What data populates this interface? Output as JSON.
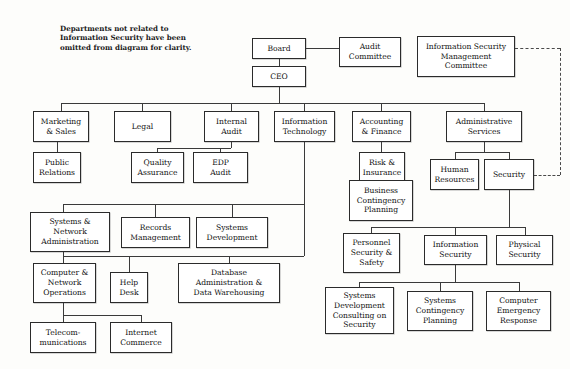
{
  "diagram": {
    "note": "Departments not related to\nInformation Security have been\nomitted from diagram for clarity.",
    "note_pos": {
      "x": 60,
      "y": 24
    },
    "canvas": {
      "width": 570,
      "height": 369
    },
    "line_color": "#3a3a3a",
    "box_border_color": "#2b2b2b",
    "box_fill": "#ffffff",
    "text_color": "#121212",
    "nodes": [
      {
        "id": "board",
        "label": "Board",
        "x": 252,
        "y": 38,
        "w": 54,
        "h": 21
      },
      {
        "id": "audit-committee",
        "label": "Audit\nCommittee",
        "x": 339,
        "y": 37,
        "w": 62,
        "h": 30
      },
      {
        "id": "ismc",
        "label": "Information Security\nManagement\nCommittee",
        "x": 417,
        "y": 36,
        "w": 98,
        "h": 41
      },
      {
        "id": "ceo",
        "label": "CEO",
        "x": 252,
        "y": 66,
        "w": 54,
        "h": 21
      },
      {
        "id": "marketing-sales",
        "label": "Marketing\n& Sales",
        "x": 33,
        "y": 111,
        "w": 56,
        "h": 31
      },
      {
        "id": "legal",
        "label": "Legal",
        "x": 114,
        "y": 111,
        "w": 57,
        "h": 31
      },
      {
        "id": "internal-audit",
        "label": "Internal\nAudit",
        "x": 204,
        "y": 111,
        "w": 55,
        "h": 31
      },
      {
        "id": "information-technology",
        "label": "Information\nTechnology",
        "x": 274,
        "y": 111,
        "w": 61,
        "h": 31
      },
      {
        "id": "accounting-finance",
        "label": "Accounting\n& Finance",
        "x": 352,
        "y": 111,
        "w": 59,
        "h": 31
      },
      {
        "id": "administrative-services",
        "label": "Administrative\nServices",
        "x": 446,
        "y": 111,
        "w": 76,
        "h": 31
      },
      {
        "id": "public-relations",
        "label": "Public\nRelations",
        "x": 33,
        "y": 152,
        "w": 48,
        "h": 31
      },
      {
        "id": "quality-assurance",
        "label": "Quality\nAssurance",
        "x": 131,
        "y": 152,
        "w": 53,
        "h": 31
      },
      {
        "id": "edp-audit",
        "label": "EDP\nAudit",
        "x": 193,
        "y": 152,
        "w": 55,
        "h": 31
      },
      {
        "id": "risk-insurance",
        "label": "Risk &\nInsurance",
        "x": 359,
        "y": 152,
        "w": 46,
        "h": 31
      },
      {
        "id": "human-resources",
        "label": "Human\nResources",
        "x": 430,
        "y": 159,
        "w": 49,
        "h": 31
      },
      {
        "id": "security",
        "label": "Security",
        "x": 484,
        "y": 159,
        "w": 50,
        "h": 31
      },
      {
        "id": "business-contingency-planning",
        "label": "Business\nContingency\nPlanning",
        "x": 349,
        "y": 180,
        "w": 64,
        "h": 41
      },
      {
        "id": "systems-network-administration",
        "label": "Systems &\nNetwork\nAdministration",
        "x": 30,
        "y": 212,
        "w": 80,
        "h": 40
      },
      {
        "id": "records-management",
        "label": "Records\nManagement",
        "x": 121,
        "y": 217,
        "w": 69,
        "h": 31
      },
      {
        "id": "systems-development",
        "label": "Systems\nDevelopment",
        "x": 196,
        "y": 217,
        "w": 72,
        "h": 31
      },
      {
        "id": "personnel-security-safety",
        "label": "Personnel\nSecurity &\nSafety",
        "x": 343,
        "y": 233,
        "w": 57,
        "h": 40
      },
      {
        "id": "information-security",
        "label": "Information\nSecurity",
        "x": 424,
        "y": 235,
        "w": 63,
        "h": 30
      },
      {
        "id": "physical-security",
        "label": "Physical\nSecurity",
        "x": 496,
        "y": 235,
        "w": 57,
        "h": 30
      },
      {
        "id": "computer-network-operations",
        "label": "Computer &\nNetwork\nOperations",
        "x": 33,
        "y": 263,
        "w": 63,
        "h": 40
      },
      {
        "id": "help-desk",
        "label": "Help\nDesk",
        "x": 110,
        "y": 272,
        "w": 38,
        "h": 31
      },
      {
        "id": "database-administration",
        "label": "Database\nAdministration &\nData Warehousing",
        "x": 178,
        "y": 263,
        "w": 102,
        "h": 40
      },
      {
        "id": "systems-development-consulting",
        "label": "Systems\nDevelopment\nConsulting on\nSecurity",
        "x": 325,
        "y": 287,
        "w": 69,
        "h": 47
      },
      {
        "id": "systems-contingency-planning",
        "label": "Systems\nContingency\nPlanning",
        "x": 407,
        "y": 291,
        "w": 66,
        "h": 40
      },
      {
        "id": "computer-emergency-response",
        "label": "Computer\nEmergency\nResponse",
        "x": 486,
        "y": 291,
        "w": 65,
        "h": 40
      },
      {
        "id": "telecommunications",
        "label": "Telecom-\nmunications",
        "x": 30,
        "y": 322,
        "w": 66,
        "h": 31
      },
      {
        "id": "internet-commerce",
        "label": "Internet\nCommerce",
        "x": 110,
        "y": 322,
        "w": 62,
        "h": 31
      }
    ],
    "edges_solid": [
      {
        "name": "board-to-audit-committee",
        "type": "h",
        "x": 306,
        "y": 48,
        "len": 33
      },
      {
        "name": "board-to-ceo",
        "type": "v",
        "x": 279,
        "y": 59,
        "len": 7
      },
      {
        "name": "ceo-down",
        "type": "v",
        "x": 279,
        "y": 87,
        "len": 16
      },
      {
        "name": "ceo-bus",
        "type": "h",
        "x": 61,
        "y": 103,
        "len": 423
      },
      {
        "name": "drop-marketing",
        "type": "v",
        "x": 61,
        "y": 103,
        "len": 9
      },
      {
        "name": "drop-legal",
        "type": "v",
        "x": 142,
        "y": 103,
        "len": 9
      },
      {
        "name": "drop-internal-audit",
        "type": "v",
        "x": 231,
        "y": 103,
        "len": 9
      },
      {
        "name": "drop-it",
        "type": "v",
        "x": 304,
        "y": 103,
        "len": 9
      },
      {
        "name": "drop-accounting",
        "type": "v",
        "x": 381,
        "y": 103,
        "len": 9
      },
      {
        "name": "drop-admin",
        "type": "v",
        "x": 484,
        "y": 103,
        "len": 9
      },
      {
        "name": "marketing-to-pr",
        "type": "v",
        "x": 57,
        "y": 142,
        "len": 11
      },
      {
        "name": "internal-audit-stem",
        "type": "v",
        "x": 231,
        "y": 142,
        "len": 6
      },
      {
        "name": "internal-audit-bus",
        "type": "h",
        "x": 157,
        "y": 148,
        "len": 74
      },
      {
        "name": "drop-qa",
        "type": "v",
        "x": 157,
        "y": 148,
        "len": 5
      },
      {
        "name": "drop-edp",
        "type": "v",
        "x": 220,
        "y": 148,
        "len": 5
      },
      {
        "name": "accounting-to-risk",
        "type": "v",
        "x": 381,
        "y": 142,
        "len": 11
      },
      {
        "name": "risk-to-bcp",
        "type": "v",
        "x": 381,
        "y": 183,
        "len": 8
      },
      {
        "name": "admin-stem",
        "type": "v",
        "x": 484,
        "y": 142,
        "len": 10
      },
      {
        "name": "admin-bus",
        "type": "h",
        "x": 455,
        "y": 152,
        "len": 54
      },
      {
        "name": "drop-hr",
        "type": "v",
        "x": 455,
        "y": 152,
        "len": 8
      },
      {
        "name": "drop-security",
        "type": "v",
        "x": 509,
        "y": 152,
        "len": 8
      },
      {
        "name": "it-stem",
        "type": "v",
        "x": 304,
        "y": 142,
        "len": 62
      },
      {
        "name": "it-bus",
        "type": "h",
        "x": 63,
        "y": 204,
        "len": 241
      },
      {
        "name": "drop-sna",
        "type": "v",
        "x": 63,
        "y": 204,
        "len": 9
      },
      {
        "name": "drop-records",
        "type": "v",
        "x": 155,
        "y": 204,
        "len": 14
      },
      {
        "name": "drop-sysdev",
        "type": "v",
        "x": 232,
        "y": 204,
        "len": 14
      },
      {
        "name": "sna-stem",
        "type": "v",
        "x": 63,
        "y": 252,
        "len": 4
      },
      {
        "name": "it-bus2-v",
        "type": "v",
        "x": 304,
        "y": 204,
        "len": 52
      },
      {
        "name": "it-bus2",
        "type": "h",
        "x": 63,
        "y": 256,
        "len": 241
      },
      {
        "name": "drop-cno",
        "type": "v",
        "x": 63,
        "y": 256,
        "len": 8
      },
      {
        "name": "drop-helpdesk",
        "type": "v",
        "x": 129,
        "y": 256,
        "len": 17
      },
      {
        "name": "drop-dba",
        "type": "v",
        "x": 229,
        "y": 256,
        "len": 8
      },
      {
        "name": "cno-stem",
        "type": "v",
        "x": 63,
        "y": 303,
        "len": 12
      },
      {
        "name": "bottom-bus",
        "type": "h",
        "x": 63,
        "y": 315,
        "len": 78
      },
      {
        "name": "drop-telecom",
        "type": "v",
        "x": 63,
        "y": 315,
        "len": 8
      },
      {
        "name": "drop-internet",
        "type": "v",
        "x": 141,
        "y": 315,
        "len": 8
      },
      {
        "name": "security-stem",
        "type": "v",
        "x": 509,
        "y": 190,
        "len": 37
      },
      {
        "name": "security-bus",
        "type": "h",
        "x": 371,
        "y": 227,
        "len": 154
      },
      {
        "name": "drop-pss",
        "type": "v",
        "x": 371,
        "y": 227,
        "len": 7
      },
      {
        "name": "drop-infosec",
        "type": "v",
        "x": 455,
        "y": 227,
        "len": 9
      },
      {
        "name": "drop-physec",
        "type": "v",
        "x": 525,
        "y": 227,
        "len": 9
      },
      {
        "name": "infosec-stem",
        "type": "v",
        "x": 455,
        "y": 265,
        "len": 17
      },
      {
        "name": "infosec-bus",
        "type": "h",
        "x": 359,
        "y": 282,
        "len": 160
      },
      {
        "name": "drop-sdcs",
        "type": "v",
        "x": 359,
        "y": 282,
        "len": 6
      },
      {
        "name": "drop-scp",
        "type": "v",
        "x": 440,
        "y": 282,
        "len": 10
      },
      {
        "name": "drop-cer",
        "type": "v",
        "x": 519,
        "y": 282,
        "len": 10
      }
    ],
    "edges_dashed": [
      {
        "name": "ismc-to-security-h1",
        "type": "h",
        "x": 515,
        "y": 48,
        "len": 45
      },
      {
        "name": "ismc-to-security-v",
        "type": "v",
        "x": 560,
        "y": 48,
        "len": 127
      },
      {
        "name": "ismc-to-security-h2",
        "type": "h",
        "x": 534,
        "y": 175,
        "len": 26
      }
    ]
  }
}
